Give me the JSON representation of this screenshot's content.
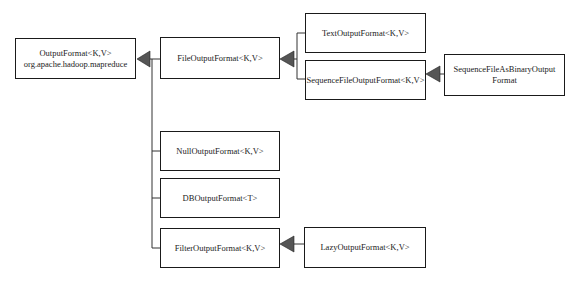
{
  "diagram": {
    "type": "class-hierarchy",
    "nodes": [
      {
        "id": "outputformat",
        "line1": "OutputFormat<K,V>",
        "line2": "org.apache.hadoop.mapreduce"
      },
      {
        "id": "fileoutputformat",
        "line1": "FileOutputFormat<K,V>"
      },
      {
        "id": "textoutputformat",
        "line1": "TextOutputFormat<K,V>"
      },
      {
        "id": "sequencefileoutputformat",
        "line1": "SequenceFileOutputFormat<K,V>"
      },
      {
        "id": "sequencefileasbinaryoutputformat",
        "line1": "SequenceFileAsBinaryOutput",
        "line2": "Format"
      },
      {
        "id": "nulloutputformat",
        "line1": "NullOutputFormat<K,V>"
      },
      {
        "id": "dboutputformat",
        "line1": "DBOutputFormat<T>"
      },
      {
        "id": "filteroutputformat",
        "line1": "FilterOutputFormat<K,V>"
      },
      {
        "id": "lazyoutputformat",
        "line1": "LazyOutputFormat<K,V>"
      }
    ],
    "edges": [
      {
        "from": "fileoutputformat",
        "to": "outputformat",
        "kind": "inherits"
      },
      {
        "from": "nulloutputformat",
        "to": "outputformat",
        "kind": "inherits"
      },
      {
        "from": "dboutputformat",
        "to": "outputformat",
        "kind": "inherits"
      },
      {
        "from": "filteroutputformat",
        "to": "outputformat",
        "kind": "inherits"
      },
      {
        "from": "textoutputformat",
        "to": "fileoutputformat",
        "kind": "inherits"
      },
      {
        "from": "sequencefileoutputformat",
        "to": "fileoutputformat",
        "kind": "inherits"
      },
      {
        "from": "sequencefileasbinaryoutputformat",
        "to": "sequencefileoutputformat",
        "kind": "inherits"
      },
      {
        "from": "lazyoutputformat",
        "to": "filteroutputformat",
        "kind": "inherits"
      }
    ],
    "colors": {
      "line": "#1a1a1a",
      "arrowhead": "#555555",
      "box_fill": "#ffffff"
    }
  }
}
